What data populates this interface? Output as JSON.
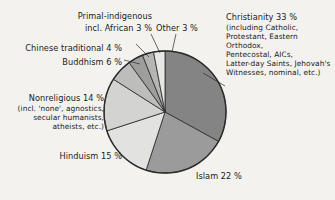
{
  "figure": {
    "kind": "pie-chart",
    "background_color": "#f3f2ef",
    "text_color": "#1b1b1b",
    "outline_color": "#2a2a2a"
  },
  "labels": {
    "christianity_title": "Christianity 33 %",
    "christianity_detail": "(including Catholic,\nProtestant, Eastern Orthodox,\nPentecostal, AICs,\nLatter-day Saints, Jehovah's\nWitnesses, nominal, etc.)",
    "other": "Other 3 %",
    "primal_line1": "Primal-indigenous",
    "primal_line2": "incl. African 3 %",
    "chinese": "Chinese traditional 4 %",
    "buddhism": "Buddhism 6 %",
    "nonreligious_title": "Nonreligious 14 %",
    "nonreligious_detail": "(incl. 'none', agnostics,\nsecular humanists,\natheists, etc.)",
    "hinduism": "Hinduism 15 %",
    "islam": "Islam 22 %"
  },
  "chart_data": {
    "type": "pie",
    "title": "",
    "subtitle": "",
    "xlabel": "",
    "ylabel": "",
    "grid": false,
    "legend_position": "none",
    "units": "percent",
    "start_angle_deg": 0,
    "direction": "clockwise",
    "center": {
      "x": 165,
      "y": 112
    },
    "radius": 61,
    "categories": [
      "Christianity",
      "Islam",
      "Hinduism",
      "Nonreligious",
      "Buddhism",
      "Chinese traditional",
      "Primal-indigenous incl. African",
      "Other"
    ],
    "values": [
      33,
      22,
      15,
      14,
      6,
      4,
      3,
      3
    ],
    "slices": [
      {
        "name": "Christianity",
        "value": 33,
        "label": "Christianity 33 %",
        "color": "#848484"
      },
      {
        "name": "Islam",
        "value": 22,
        "label": "Islam 22 %",
        "color": "#9b9b9b"
      },
      {
        "name": "Hinduism",
        "value": 15,
        "label": "Hinduism 15 %",
        "color": "#e2e2e0"
      },
      {
        "name": "Nonreligious",
        "value": 14,
        "label": "Nonreligious 14 %",
        "color": "#d3d3d1"
      },
      {
        "name": "Buddhism",
        "value": 6,
        "label": "Buddhism 6 %",
        "color": "#bdbdbb"
      },
      {
        "name": "Chinese traditional",
        "value": 4,
        "label": "Chinese traditional 4 %",
        "color": "#9e9e9c"
      },
      {
        "name": "Primal-indigenous incl. African",
        "value": 3,
        "label": "Primal-indigenous incl. African 3 %",
        "color": "#b5b5b3"
      },
      {
        "name": "Other",
        "value": 3,
        "label": "Other 3 %",
        "color": "#e7e7e5"
      }
    ]
  }
}
